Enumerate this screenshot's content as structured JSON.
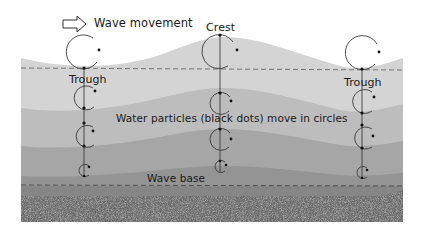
{
  "labels": {
    "wave_movement": "Wave movement",
    "crest": "Crest",
    "trough_left": "Trough",
    "trough_right": "Trough",
    "particles": "Water particles (black dots) move in circles",
    "wave_base": "Wave base"
  },
  "icons": {
    "direction_arrow": "hollow-right-arrow-icon"
  },
  "colors": {
    "layer1": "#d4d4d4",
    "layer2": "#bdbdbd",
    "layer3": "#a6a6a6",
    "layer4": "#949494",
    "layer5": "#868686",
    "sediment": "#555555",
    "dash": "#6a6a6a",
    "orbit": "#3a3a3a",
    "dot": "#111111"
  },
  "columns": [
    {
      "position": "trough",
      "x": 84,
      "orbits": [
        {
          "cy": 50,
          "r": 17
        },
        {
          "cy": 96,
          "r": 12
        },
        {
          "cy": 134,
          "r": 11
        },
        {
          "cy": 170,
          "r": 6
        }
      ]
    },
    {
      "position": "crest",
      "x": 220,
      "orbits": [
        {
          "cy": 52,
          "r": 17
        },
        {
          "cy": 104,
          "r": 11
        },
        {
          "cy": 140,
          "r": 11
        },
        {
          "cy": 167,
          "r": 6
        }
      ]
    },
    {
      "position": "trough",
      "x": 362,
      "orbits": [
        {
          "cy": 52,
          "r": 17
        },
        {
          "cy": 100,
          "r": 12
        },
        {
          "cy": 136,
          "r": 11
        },
        {
          "cy": 172,
          "r": 6
        }
      ]
    }
  ]
}
